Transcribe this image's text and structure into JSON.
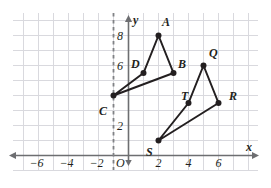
{
  "figure": {
    "title": "",
    "type": "coordinate-plane-reflection",
    "background_color": "#ffffff",
    "grid_color": "#d9d9de",
    "axis_color": "#6d6e71",
    "shape_color": "#231f20",
    "dash_color": "#808285"
  },
  "axes": {
    "x_label": "x",
    "y_label": "y",
    "origin_label": "O",
    "x_ticks": [
      {
        "value": -6,
        "label": "−6"
      },
      {
        "value": -4,
        "label": "−4"
      },
      {
        "value": -2,
        "label": "−2"
      },
      {
        "value": 2,
        "label": "2"
      },
      {
        "value": 4,
        "label": "4"
      },
      {
        "value": 6,
        "label": "6"
      }
    ],
    "y_ticks": [
      {
        "value": 8,
        "label": "8"
      },
      {
        "value": 6,
        "label": "6"
      },
      {
        "value": 2,
        "label": "2"
      }
    ],
    "x_range": [
      -7,
      7
    ],
    "y_range": [
      -0.5,
      9
    ],
    "grid": true
  },
  "reflection_line": {
    "name": "line-of-reflection",
    "orientation": "vertical",
    "x": -1,
    "style": "dashed"
  },
  "chart_data": {
    "type": "scatter",
    "title": "",
    "xlabel": "x",
    "ylabel": "y",
    "points": [
      {
        "label": "A",
        "x": 2,
        "y": 8
      },
      {
        "label": "B",
        "x": 3,
        "y": 5.5
      },
      {
        "label": "C",
        "x": -1,
        "y": 4
      },
      {
        "label": "D",
        "x": 1,
        "y": 5.5
      },
      {
        "label": "Q",
        "x": 5,
        "y": 6
      },
      {
        "label": "R",
        "x": 6,
        "y": 3.5
      },
      {
        "label": "S",
        "x": 2,
        "y": 1
      },
      {
        "label": "T",
        "x": 4,
        "y": 3.5
      }
    ],
    "polygons": [
      {
        "name": "figure-ABCD",
        "vertices": [
          "A",
          "B",
          "C",
          "D"
        ]
      },
      {
        "name": "figure-QRST",
        "vertices": [
          "Q",
          "R",
          "S",
          "T"
        ]
      }
    ]
  },
  "point_labels": {
    "A": {
      "text": "A",
      "x": 162,
      "y": 16
    },
    "B": {
      "text": "B",
      "x": 178,
      "y": 58
    },
    "C": {
      "text": "C",
      "x": 99,
      "y": 105
    },
    "D": {
      "text": "D",
      "x": 131,
      "y": 58
    },
    "Q": {
      "text": "Q",
      "x": 209,
      "y": 47
    },
    "R": {
      "text": "R",
      "x": 229,
      "y": 90
    },
    "S": {
      "text": "S",
      "x": 146,
      "y": 146
    },
    "T": {
      "text": "T",
      "x": 181,
      "y": 90
    }
  }
}
